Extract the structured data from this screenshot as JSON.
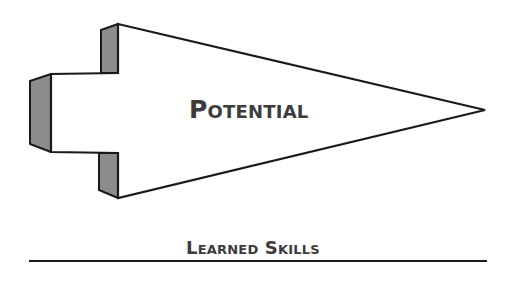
{
  "diagram": {
    "arrow": {
      "label": "Potential",
      "fill": "#ffffff",
      "stroke": "#1a1a1a",
      "shade_fill": "#8c8c8c"
    },
    "baseline": {
      "label": "Learned Skills",
      "stroke": "#1a1a1a"
    }
  }
}
